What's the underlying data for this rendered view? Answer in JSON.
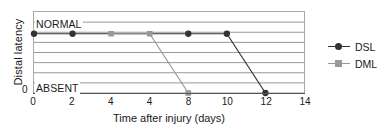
{
  "chart_data": {
    "type": "line",
    "title": "",
    "xlabel": "Time after injury (days)",
    "ylabel": "Distal latency",
    "xlim": [
      0,
      14
    ],
    "ylim": [
      0,
      1
    ],
    "grid": true,
    "gridlines_y": 8,
    "legend_position": "right",
    "x_ticks": [
      0,
      2,
      4,
      6,
      8,
      10,
      12,
      14
    ],
    "x_tick_labels": [
      "0",
      "2",
      "4",
      "4",
      "8",
      "10",
      "12",
      "14"
    ],
    "y_tick_labels": [
      "0"
    ],
    "y_category_labels": [
      {
        "name": "NORMAL",
        "value": 1
      },
      {
        "name": "ABSENT",
        "value": 0
      }
    ],
    "series": [
      {
        "name": "DSL",
        "marker": "circle",
        "color": "#333333",
        "points": [
          {
            "x": 0,
            "y": 1,
            "label": "NORMAL"
          },
          {
            "x": 2,
            "y": 1,
            "label": "NORMAL"
          },
          {
            "x": 8,
            "y": 1,
            "label": "NORMAL"
          },
          {
            "x": 10,
            "y": 1,
            "label": "NORMAL"
          },
          {
            "x": 12,
            "y": 0,
            "label": "ABSENT"
          }
        ]
      },
      {
        "name": "DML",
        "marker": "square",
        "color": "#999999",
        "points": [
          {
            "x": 4,
            "y": 1,
            "label": "NORMAL"
          },
          {
            "x": 6,
            "y": 1,
            "label": "NORMAL"
          },
          {
            "x": 8,
            "y": 0,
            "label": "ABSENT"
          }
        ]
      }
    ]
  },
  "legend": {
    "entries": [
      {
        "label": "DSL",
        "marker": "circle",
        "color": "#333333"
      },
      {
        "label": "DML",
        "marker": "square",
        "color": "#999999"
      }
    ]
  },
  "colors": {
    "dsl": "#333333",
    "dml": "#999999",
    "grid": "#8c8c8c",
    "axis": "#555555",
    "frame": "#a8a8a8",
    "text": "#1a1a1a",
    "background": "#ffffff"
  }
}
